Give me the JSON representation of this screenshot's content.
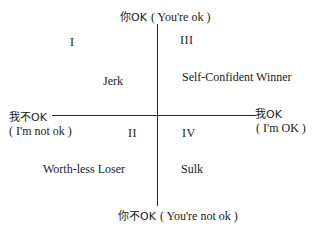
{
  "axes": {
    "top": {
      "cn": "你OK",
      "en": "( You're ok )"
    },
    "bottom": {
      "cn": "你不OK",
      "en": "( You're not ok )"
    },
    "left": {
      "cn": "我不OK",
      "en": "( I'm not ok )"
    },
    "right": {
      "cn": "我OK",
      "en": "( I'm OK )"
    }
  },
  "quadrants": [
    {
      "numeral": "I",
      "label": "Jerk"
    },
    {
      "numeral": "II",
      "label": "Worth-less Loser"
    },
    {
      "numeral": "III",
      "label": "Self-Confident  Winner"
    },
    {
      "numeral": "IV",
      "label": "Sulk"
    }
  ]
}
